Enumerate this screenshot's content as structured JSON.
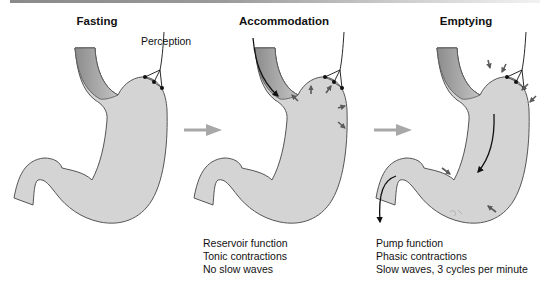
{
  "panels": [
    {
      "title": "Fasting",
      "label": "Perception",
      "notes": []
    },
    {
      "title": "Accommodation",
      "notes": [
        "Reservoir function",
        "Tonic contractions",
        "No slow waves"
      ]
    },
    {
      "title": "Emptying",
      "notes": [
        "Pump function",
        "Phasic contractions",
        "Slow waves, 3 cycles per minute"
      ]
    }
  ],
  "colors": {
    "stomach_fill": "#d4d4d4",
    "stomach_outline": "#555555",
    "esophagus_dark": "#8c8c8c",
    "esophagus_light": "#c8c8c8",
    "transition_arrow": "#a8a8a8",
    "force_arrow": "#5a5a5a",
    "flow_arrow": "#111111"
  }
}
